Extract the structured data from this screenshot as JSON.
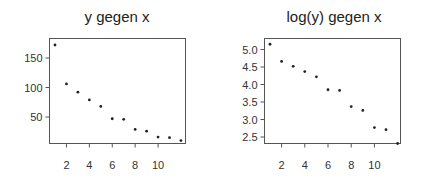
{
  "chart_data": [
    {
      "type": "scatter",
      "title": "y gegen x",
      "xlabel": "",
      "ylabel": "",
      "x": [
        1,
        2,
        3,
        4,
        5,
        6,
        7,
        8,
        9,
        10,
        11,
        12
      ],
      "y": [
        172,
        106,
        92,
        79,
        68,
        47,
        46,
        29,
        26,
        16,
        15,
        10
      ],
      "xticks": [
        2,
        4,
        6,
        8,
        10
      ],
      "xtick_labels": [
        "2",
        "4",
        "6",
        "8",
        "10"
      ],
      "yticks": [
        50,
        100,
        150
      ],
      "ytick_labels": [
        "50",
        "100",
        "150"
      ],
      "xlim": [
        0.6,
        12.2
      ],
      "ylim": [
        5,
        182
      ],
      "grid": false,
      "legend": null
    },
    {
      "type": "scatter",
      "title": "log(y) gegen x",
      "xlabel": "",
      "ylabel": "",
      "x": [
        1,
        2,
        3,
        4,
        5,
        6,
        7,
        8,
        9,
        10,
        11,
        12
      ],
      "y": [
        5.15,
        4.66,
        4.52,
        4.37,
        4.22,
        3.85,
        3.83,
        3.37,
        3.26,
        2.77,
        2.71,
        2.3
      ],
      "xticks": [
        2,
        4,
        6,
        8,
        10
      ],
      "xtick_labels": [
        "2",
        "4",
        "6",
        "8",
        "10"
      ],
      "yticks": [
        2.5,
        3.0,
        3.5,
        4.0,
        4.5,
        5.0
      ],
      "ytick_labels": [
        "2.5",
        "3.0",
        "3.5",
        "4.0",
        "4.5",
        "5.0"
      ],
      "xlim": [
        0.6,
        12.2
      ],
      "ylim": [
        2.29,
        5.3
      ],
      "grid": false,
      "legend": null
    }
  ],
  "panels": [
    {
      "title": "y gegen x"
    },
    {
      "title": "log(y) gegen x"
    }
  ]
}
